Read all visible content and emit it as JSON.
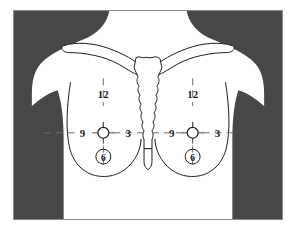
{
  "figure": {
    "kind": "anatomical-diagram",
    "background_color": "#ffffff",
    "silhouette_color": "#474747",
    "body_fill": "#ffffff",
    "outline_color": "#1a1a1a",
    "frame_border_color": "#8a8a8a"
  },
  "anatomy": {
    "clavicle_left_name": "clavicle-left",
    "clavicle_right_name": "clavicle-right",
    "sternum_name": "sternum",
    "xiphoid_name": "xiphoid-process",
    "breast_left_name": "breast-outline-left",
    "breast_right_name": "breast-outline-right",
    "nipple_left_name": "nipple-left",
    "nipple_right_name": "nipple-right"
  },
  "left_breast": {
    "label": "left-breast",
    "clock_positions": [
      {
        "hour": "12",
        "position": "superior",
        "circled": false
      },
      {
        "hour": "3",
        "position": "medial",
        "circled": false
      },
      {
        "hour": "6",
        "position": "inferior",
        "circled": true
      },
      {
        "hour": "9",
        "position": "lateral",
        "circled": false
      }
    ]
  },
  "right_breast": {
    "label": "right-breast",
    "clock_positions": [
      {
        "hour": "12",
        "position": "superior",
        "circled": false
      },
      {
        "hour": "3",
        "position": "medial",
        "circled": false
      },
      {
        "hour": "6",
        "position": "inferior",
        "circled": true
      },
      {
        "hour": "9",
        "position": "lateral",
        "circled": false
      }
    ]
  }
}
